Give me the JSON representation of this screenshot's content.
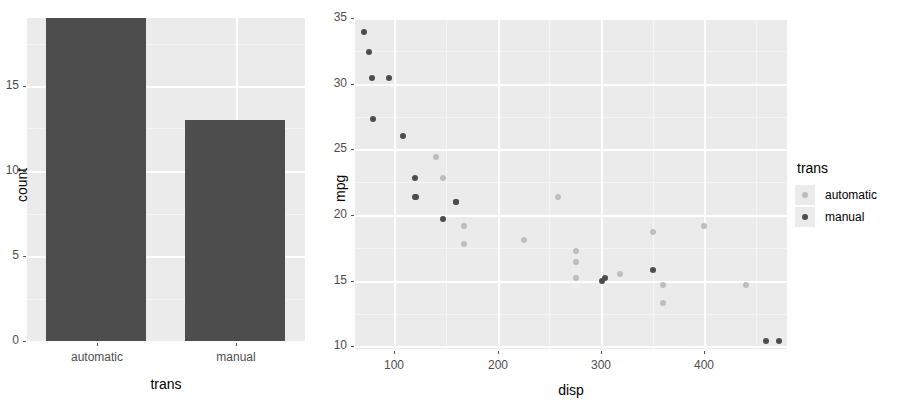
{
  "figure": {
    "background": "#ffffff",
    "panel_background": "#ebebeb",
    "gridline_major_color": "#ffffff",
    "gridline_minor_color": "#f5f5f5"
  },
  "colors": {
    "automatic": "#bdbdbd",
    "manual": "#4d4d4d",
    "bar_fill": "#4d4d4d",
    "axis_text": "#4d4d4d",
    "axis_title": "#000000"
  },
  "chart_data": [
    {
      "type": "bar",
      "title": "",
      "xlabel": "trans",
      "ylabel": "count",
      "categories": [
        "automatic",
        "manual"
      ],
      "values": [
        19,
        13
      ],
      "ylim": [
        0,
        19
      ],
      "yticks": [
        0,
        5,
        10,
        15
      ],
      "ytick_labels": [
        "0",
        "5",
        "10",
        "15"
      ],
      "grid": true,
      "legend": "none",
      "bar_color": "#4d4d4d"
    },
    {
      "type": "scatter",
      "title": "",
      "xlabel": "disp",
      "ylabel": "mpg",
      "xlim": [
        62,
        480
      ],
      "ylim": [
        9.8,
        35
      ],
      "xticks": [
        100,
        200,
        300,
        400
      ],
      "xtick_labels": [
        "100",
        "200",
        "300",
        "400"
      ],
      "yticks": [
        10,
        15,
        20,
        25,
        30,
        35
      ],
      "ytick_labels": [
        "10",
        "15",
        "20",
        "25",
        "30",
        "35"
      ],
      "grid": true,
      "legend_position": "right",
      "legend_title": "trans",
      "series": [
        {
          "name": "automatic",
          "color": "#bdbdbd",
          "points": [
            [
              140.8,
              24.4
            ],
            [
              146.7,
              22.8
            ],
            [
              167.6,
              19.2
            ],
            [
              167.6,
              17.8
            ],
            [
              225.0,
              18.1
            ],
            [
              258.0,
              21.4
            ],
            [
              275.8,
              17.3
            ],
            [
              275.8,
              16.4
            ],
            [
              275.8,
              15.2
            ],
            [
              318.0,
              15.5
            ],
            [
              350.0,
              18.7
            ],
            [
              360.0,
              14.7
            ],
            [
              360.0,
              13.3
            ],
            [
              400.0,
              19.2
            ],
            [
              440.0,
              14.7
            ]
          ]
        },
        {
          "name": "manual",
          "color": "#4d4d4d",
          "points": [
            [
              71.1,
              33.9
            ],
            [
              75.7,
              32.4
            ],
            [
              78.7,
              30.4
            ],
            [
              95.1,
              30.4
            ],
            [
              79.0,
              27.3
            ],
            [
              108.0,
              26.0
            ],
            [
              120.1,
              22.8
            ],
            [
              120.3,
              21.4
            ],
            [
              121.0,
              21.4
            ],
            [
              146.7,
              19.7
            ],
            [
              160.0,
              21.0
            ],
            [
              160.0,
              21.0
            ],
            [
              301.0,
              15.0
            ],
            [
              304.0,
              15.2
            ],
            [
              350.0,
              15.8
            ],
            [
              460.0,
              10.4
            ],
            [
              472.0,
              10.4
            ]
          ]
        }
      ]
    }
  ],
  "legend": {
    "title": "trans",
    "items": [
      {
        "label": "automatic",
        "color": "#bdbdbd"
      },
      {
        "label": "manual",
        "color": "#4d4d4d"
      }
    ]
  }
}
